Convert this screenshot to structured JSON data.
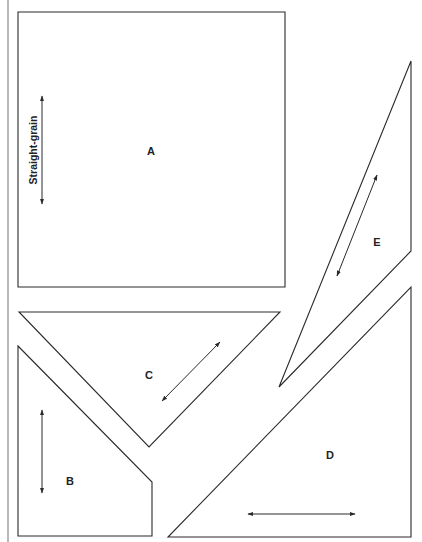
{
  "diagram": {
    "type": "sewing-pattern-pieces",
    "colors": {
      "line": "#2a2a2a",
      "margin": "#b8b8b8",
      "background": "#ffffff"
    },
    "grain_label": "Straight-grain",
    "pieces": [
      {
        "id": "A",
        "label": "A",
        "shape": "square",
        "points": [
          [
            18,
            12
          ],
          [
            285,
            12
          ],
          [
            285,
            287
          ],
          [
            18,
            287
          ]
        ],
        "label_pos": [
          151,
          155
        ],
        "grain_arrow": [
          [
            42,
            96
          ],
          [
            42,
            204
          ]
        ]
      },
      {
        "id": "B",
        "label": "B",
        "shape": "pentagon",
        "points": [
          [
            18,
            346
          ],
          [
            152,
            482
          ],
          [
            152,
            536
          ],
          [
            18,
            536
          ]
        ],
        "label_pos": [
          70,
          485
        ],
        "grain_arrow": [
          [
            42,
            410
          ],
          [
            42,
            493
          ]
        ]
      },
      {
        "id": "C",
        "label": "C",
        "shape": "triangle",
        "points": [
          [
            19,
            312
          ],
          [
            280,
            312
          ],
          [
            149,
            447
          ]
        ],
        "label_pos": [
          149,
          379
        ],
        "grain_arrow": [
          [
            162,
            401
          ],
          [
            220,
            342
          ]
        ]
      },
      {
        "id": "D",
        "label": "D",
        "shape": "triangle",
        "points": [
          [
            411,
            287
          ],
          [
            411,
            537
          ],
          [
            168,
            537
          ]
        ],
        "label_pos": [
          330,
          459
        ],
        "grain_arrow": [
          [
            248,
            514
          ],
          [
            355,
            514
          ]
        ]
      },
      {
        "id": "E",
        "label": "E",
        "shape": "triangle",
        "points": [
          [
            411,
            61
          ],
          [
            411,
            251
          ],
          [
            279,
            387
          ]
        ],
        "label_pos": [
          377,
          246
        ],
        "grain_arrow": [
          [
            377,
            175
          ],
          [
            337,
            276
          ]
        ]
      }
    ]
  }
}
